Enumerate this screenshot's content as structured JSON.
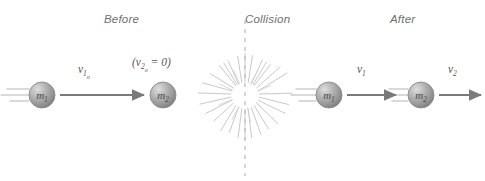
{
  "figure": {
    "type": "physics-collision-diagram",
    "width": 485,
    "height": 181,
    "background": "#ffffff"
  },
  "colors": {
    "header_text": "#6f6f6f",
    "label_text": "#585858",
    "arrow": "#7a7a7a",
    "sphere_light": "#d8d8d8",
    "sphere_mid": "#a8a8a8",
    "sphere_dark": "#7c7c7c",
    "sphere_outline": "#8a8a8a",
    "trail_line": "#b5b5b5",
    "burst_ray": "#c9c9c9",
    "dash_line": "#bdbdbd"
  },
  "stages": [
    {
      "id": "before",
      "label": "Before",
      "x": 104,
      "y": 13
    },
    {
      "id": "collision",
      "label": "Collision",
      "x": 245,
      "y": 13
    },
    {
      "id": "after",
      "label": "After",
      "x": 390,
      "y": 13
    }
  ],
  "bodies": [
    {
      "id": "before-m1",
      "mass_label": "m",
      "mass_subscript": "1",
      "cx": 42,
      "cy": 95,
      "r": 13,
      "has_trails": true,
      "stage": "before"
    },
    {
      "id": "before-m2",
      "mass_label": "m",
      "mass_subscript": "2",
      "cx": 163,
      "cy": 95,
      "r": 13,
      "has_trails": false,
      "stage": "before"
    },
    {
      "id": "after-m1",
      "mass_label": "m",
      "mass_subscript": "1",
      "cx": 329,
      "cy": 95,
      "r": 13,
      "has_trails": true,
      "stage": "after"
    },
    {
      "id": "after-m2",
      "mass_label": "m",
      "mass_subscript": "2",
      "cx": 421,
      "cy": 95,
      "r": 13,
      "has_trails": true,
      "stage": "after"
    }
  ],
  "velocity_labels": [
    {
      "id": "v1o",
      "base": "v",
      "sub": "1",
      "subsub": "o",
      "text": "v1o",
      "x": 78,
      "y": 63,
      "parenthesized": false
    },
    {
      "id": "v2o-zero",
      "base": "v",
      "sub": "2",
      "subsub": "o",
      "text": "(v2o = 0)",
      "x": 132,
      "y": 56,
      "parenthesized": true,
      "equals": " = 0)",
      "open": "("
    },
    {
      "id": "v1-after",
      "base": "v",
      "sub": "1",
      "subsub": "",
      "text": "v1",
      "x": 357,
      "y": 63,
      "parenthesized": false
    },
    {
      "id": "v2-after",
      "base": "v",
      "sub": "2",
      "subsub": "",
      "text": "v2",
      "x": 448,
      "y": 63,
      "parenthesized": false
    }
  ],
  "arrows": [
    {
      "id": "arrow-v1o",
      "x1": 60,
      "y1": 95,
      "x2": 146,
      "y2": 95
    },
    {
      "id": "arrow-v1-after",
      "x1": 347,
      "y1": 95,
      "x2": 398,
      "y2": 95
    },
    {
      "id": "arrow-v2-after",
      "x1": 439,
      "y1": 95,
      "x2": 484,
      "y2": 95
    }
  ],
  "collision_burst": {
    "cx": 245,
    "cy": 95,
    "ray_count": 28,
    "inner_radius_min": 10,
    "inner_radius_max": 16,
    "outer_radius_min": 30,
    "outer_radius_max": 47
  },
  "dashed_divider": {
    "x": 245,
    "y_top": 20,
    "y_bottom": 176,
    "dash": "4 5"
  },
  "motion_trails": {
    "line_count": 3,
    "lengths": [
      20,
      26,
      17
    ],
    "y_offsets": [
      -6,
      0,
      6
    ]
  }
}
